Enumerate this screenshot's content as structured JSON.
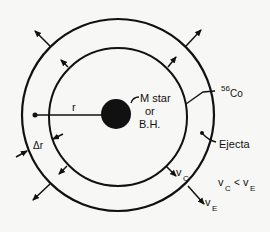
{
  "diagram": {
    "type": "expanding-ejecta-shell",
    "labels": {
      "core_line1": "M star",
      "core_line2": "or",
      "core_line3": "B.H.",
      "radius": "r",
      "thickness": "Δr",
      "cobalt_mass": "56",
      "cobalt_symbol": "Co",
      "ejecta": "Ejecta",
      "v_c_base": "v",
      "v_c_sub": "C",
      "v_e_base": "v",
      "v_e_sub": "E",
      "inequality_lhs_base": "v",
      "inequality_lhs_sub": "C",
      "inequality_op": "<",
      "inequality_rhs_base": "v",
      "inequality_rhs_sub": "E"
    },
    "colors": {
      "ink": "#111111",
      "background": "#f7f7f5"
    }
  }
}
